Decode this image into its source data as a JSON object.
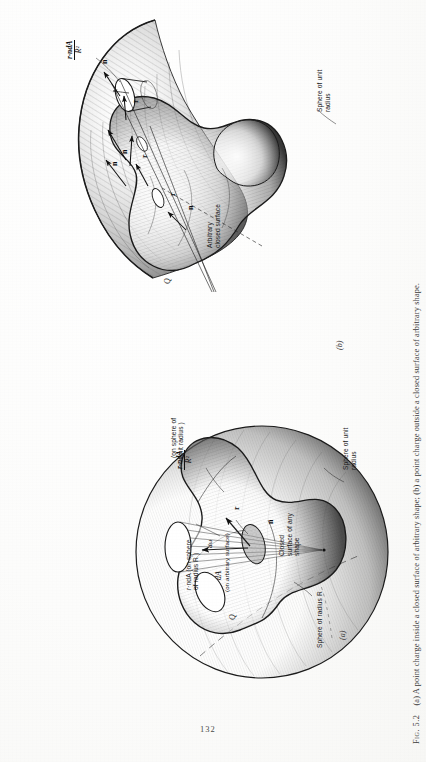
{
  "page": {
    "number": "132",
    "background_hex": "#fdfdfc",
    "ink_hex": "#1b1b1b",
    "orientation": "rotated-90-ccw"
  },
  "caption": {
    "fig_label": "Fig. 5.2",
    "text": "(a) A point charge inside a closed surface of arbitrary shape; (b) a point charge outside a closed surface of arbitrary shape."
  },
  "figures": [
    {
      "id": "a",
      "sub_label": "(a)",
      "annotations": {
        "flux_fraction_num": "r·ndA",
        "flux_fraction_den": "R²",
        "flux_unit_sphere": "(on sphere of unit radius )",
        "flux_radius_sphere": "r·ndA (on sphere of radius R )",
        "dA_label": "dA",
        "dA_qualifier": "(on arbitrary surface)",
        "solid_angle": "dω",
        "charge": "Q",
        "vector_r": "r",
        "vector_n": "n",
        "closed_surface": "Closed surface of any shape",
        "sphere_unit": "Sphere of unit radius",
        "sphere_radius_R": "Sphere of radius R"
      }
    },
    {
      "id": "b",
      "sub_label": "(b)",
      "annotations": {
        "flux_fraction_num": "r·ndA",
        "flux_fraction_den": "R²",
        "charge": "Q",
        "vector_r": "r",
        "vector_n": "n",
        "arbitrary_surface": "Arbitrary closed surface",
        "sphere_unit": "Sphere of unit radius"
      }
    }
  ]
}
